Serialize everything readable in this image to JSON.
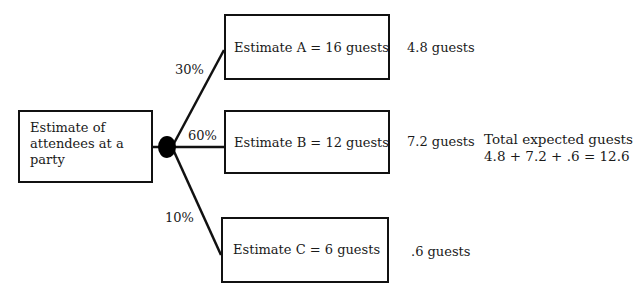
{
  "diagram": {
    "type": "decision-tree",
    "root": {
      "label": "Estimate of attendees at a party",
      "lines": [
        "Estimate of",
        "attendees at a",
        "party"
      ]
    },
    "branches": [
      {
        "probability": "30%",
        "estimate": "Estimate A = 16 guests",
        "expected": "4.8 guests"
      },
      {
        "probability": "60%",
        "estimate": "Estimate B = 12 guests",
        "expected": "7.2 guests"
      },
      {
        "probability": "10%",
        "estimate": "Estimate C = 6 guests",
        "expected": ".6 guests"
      }
    ],
    "total": {
      "title": "Total expected guests",
      "formula": "4.8 + 7.2 + .6 = 12.6"
    }
  }
}
